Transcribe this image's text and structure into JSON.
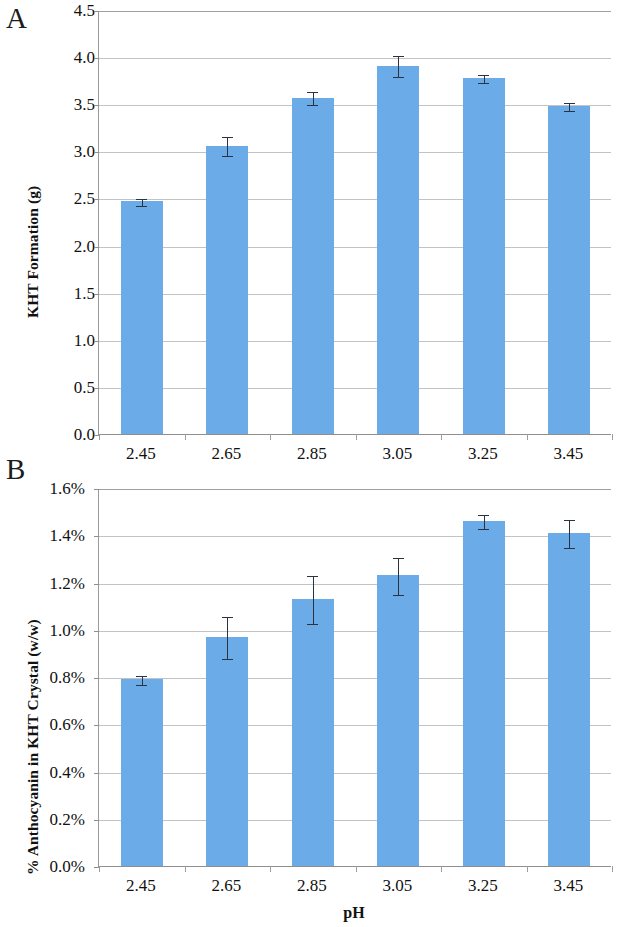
{
  "figure": {
    "panel_a_letter": "A",
    "panel_b_letter": "B"
  },
  "chart_data": [
    {
      "panel": "A",
      "type": "bar",
      "title": "",
      "xlabel": "",
      "ylabel": "KHT Formation (g)",
      "categories": [
        "2.45",
        "2.65",
        "2.85",
        "3.05",
        "3.25",
        "3.45"
      ],
      "values": [
        2.47,
        3.06,
        3.57,
        3.91,
        3.78,
        3.48
      ],
      "errors": [
        0.04,
        0.1,
        0.07,
        0.11,
        0.04,
        0.04
      ],
      "ylim": [
        0.0,
        4.5
      ],
      "ytick_labels": [
        "0.0",
        "0.5",
        "1.0",
        "1.5",
        "2.0",
        "2.5",
        "3.0",
        "3.5",
        "4.0",
        "4.5"
      ],
      "ytick_values": [
        0.0,
        0.5,
        1.0,
        1.5,
        2.0,
        2.5,
        3.0,
        3.5,
        4.0,
        4.5
      ],
      "grid": true,
      "legend": "none",
      "bar_color": "#6BABE8",
      "error_color": "#2b3340"
    },
    {
      "panel": "B",
      "type": "bar",
      "title": "",
      "xlabel": "pH",
      "ylabel": "% Anthocyanin in KHT Crystal (w/w)",
      "categories": [
        "2.45",
        "2.65",
        "2.85",
        "3.05",
        "3.25",
        "3.45"
      ],
      "values": [
        0.79,
        0.97,
        1.13,
        1.23,
        1.46,
        1.41
      ],
      "errors": [
        0.02,
        0.09,
        0.1,
        0.08,
        0.03,
        0.06
      ],
      "ylim": [
        0.0,
        1.6
      ],
      "ytick_labels": [
        "0.0%",
        "0.2%",
        "0.4%",
        "0.6%",
        "0.8%",
        "1.0%",
        "1.2%",
        "1.4%",
        "1.6%"
      ],
      "ytick_values": [
        0.0,
        0.2,
        0.4,
        0.6,
        0.8,
        1.0,
        1.2,
        1.4,
        1.6
      ],
      "grid": true,
      "legend": "none",
      "bar_color": "#6BABE8",
      "error_color": "#2b3340"
    }
  ]
}
